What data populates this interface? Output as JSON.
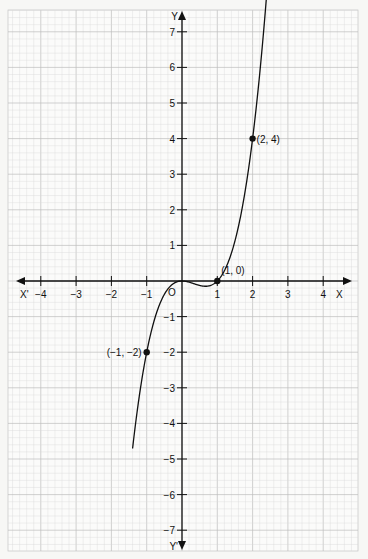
{
  "chart_data": {
    "type": "line",
    "title": "",
    "function": "y = x^3 - x^2",
    "xlabel": "X",
    "xlabel_neg": "X'",
    "ylabel": "Y",
    "ylabel_neg": "Y'",
    "origin_label": "O",
    "xlim": [
      -4.9,
      4.9
    ],
    "ylim": [
      -7.6,
      7.6
    ],
    "xticks": [
      -4,
      -3,
      -2,
      -1,
      1,
      2,
      3,
      4
    ],
    "yticks": [
      -7,
      -6,
      -5,
      -4,
      -3,
      -2,
      -1,
      1,
      2,
      3,
      4,
      5,
      6,
      7
    ],
    "grid": true,
    "curve_x_range": [
      -1.4,
      2.4
    ],
    "points": [
      {
        "x": -1,
        "y": -2,
        "label": "(−1, −2)"
      },
      {
        "x": 1,
        "y": 0,
        "label": "(1, 0)"
      },
      {
        "x": 2,
        "y": 4,
        "label": "(2, 4)"
      }
    ]
  },
  "colors": {
    "grid_minor": "#d9d9d9",
    "grid_major": "#bdbdbd",
    "ink": "#111111",
    "paper": "#f7f7f5"
  }
}
